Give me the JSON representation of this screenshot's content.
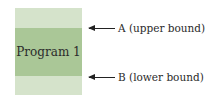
{
  "diagram": {
    "box": {
      "label": "Program 1",
      "colors": {
        "light": "#d3e2c8",
        "dark": "#a8c595"
      }
    },
    "annotations": [
      {
        "label": "A (upper bound)",
        "target": "top of dark band"
      },
      {
        "label": "B (lower bound)",
        "target": "bottom of dark band"
      }
    ]
  }
}
